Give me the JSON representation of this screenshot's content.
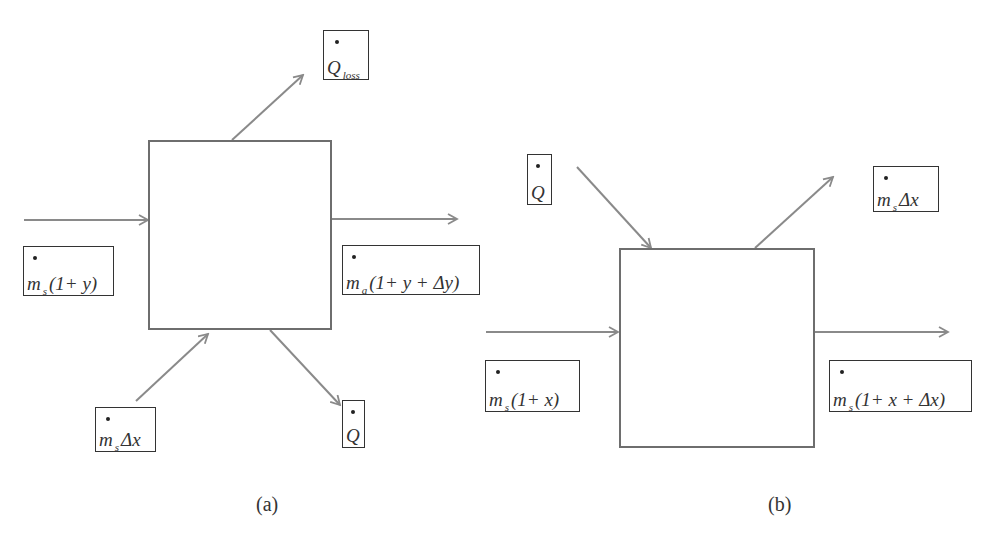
{
  "diagram_a": {
    "caption": "(a)",
    "labels": {
      "inlet": {
        "symbol": "m",
        "sub": "s",
        "rest": "(1+ y)"
      },
      "outlet": {
        "symbol": "m",
        "sub": "a",
        "rest": "(1+ y + Δy)"
      },
      "q_loss": {
        "symbol": "Q",
        "sub": "loss",
        "rest": ""
      },
      "bottom_in": {
        "symbol": "m",
        "sub": "s",
        "rest": " Δx"
      },
      "bottom_out": {
        "symbol": "Q",
        "sub": "",
        "rest": ""
      }
    }
  },
  "diagram_b": {
    "caption": "(b)",
    "labels": {
      "heat_in": {
        "symbol": "Q",
        "sub": "",
        "rest": ""
      },
      "top_out": {
        "symbol": "m",
        "sub": "s",
        "rest": " Δx"
      },
      "inlet": {
        "symbol": "m",
        "sub": "s",
        "rest": "(1+ x)"
      },
      "outlet": {
        "symbol": "m",
        "sub": "s",
        "rest": "(1+ x + Δx)"
      }
    }
  },
  "colors": {
    "arrow": "#8a8a8a",
    "box": "#6e6e6e",
    "text": "#333333"
  }
}
